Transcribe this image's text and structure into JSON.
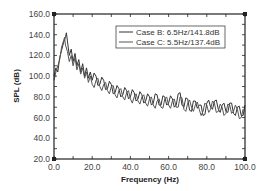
{
  "chart_data": {
    "type": "line",
    "title": "",
    "xlabel": "Frequency (Hz)",
    "ylabel": "SPL (dB)",
    "xlim": [
      0,
      100
    ],
    "ylim": [
      20,
      160
    ],
    "x_ticks": [
      "0.0",
      "20.0",
      "40.0",
      "60.0",
      "80.0",
      "100.0"
    ],
    "y_ticks": [
      "20.0",
      "40.0",
      "60.0",
      "80.0",
      "100.0",
      "120.0",
      "140.0",
      "160.0"
    ],
    "grid": false,
    "legend_position": "upper right",
    "series": [
      {
        "name": "Case B: 6.5Hz/141.8dB",
        "color": "#333333",
        "x": [
          0,
          1,
          2,
          3,
          4,
          5,
          6,
          6.5,
          7,
          8,
          9,
          10,
          11,
          12,
          13,
          14,
          15,
          16,
          17,
          18,
          19,
          20,
          22,
          24,
          26,
          28,
          30,
          32,
          34,
          36,
          38,
          40,
          42,
          44,
          46,
          48,
          50,
          52,
          54,
          56,
          58,
          60,
          62,
          64,
          66,
          68,
          70,
          72,
          74,
          76,
          78,
          80,
          82,
          84,
          86,
          88,
          90,
          92,
          94,
          96,
          98,
          100
        ],
        "y": [
          100,
          108,
          104,
          118,
          125,
          132,
          138,
          141.8,
          134,
          120,
          126,
          114,
          122,
          110,
          116,
          104,
          112,
          100,
          108,
          98,
          104,
          96,
          100,
          92,
          96,
          88,
          92,
          84,
          88,
          82,
          86,
          80,
          84,
          78,
          82,
          76,
          80,
          74,
          82,
          72,
          80,
          74,
          78,
          72,
          84,
          70,
          78,
          66,
          76,
          72,
          62,
          74,
          70,
          76,
          68,
          72,
          66,
          74,
          64,
          70,
          62,
          72
        ],
        "peak": {
          "frequency_hz": 6.5,
          "spl_db": 141.8
        }
      },
      {
        "name": "Case C: 5.5Hz/137.4dB",
        "color": "#555555",
        "x": [
          0,
          1,
          2,
          3,
          4,
          5,
          5.5,
          6,
          7,
          8,
          9,
          10,
          11,
          12,
          13,
          14,
          15,
          16,
          17,
          18,
          19,
          20,
          22,
          24,
          26,
          28,
          30,
          32,
          34,
          36,
          38,
          40,
          42,
          44,
          46,
          48,
          50,
          52,
          54,
          56,
          58,
          60,
          62,
          64,
          66,
          68,
          70,
          72,
          74,
          76,
          78,
          80,
          82,
          84,
          86,
          88,
          90,
          92,
          94,
          96,
          98,
          100
        ],
        "y": [
          96,
          104,
          110,
          116,
          128,
          134,
          137.4,
          130,
          124,
          114,
          120,
          110,
          118,
          106,
          112,
          102,
          108,
          98,
          104,
          94,
          100,
          92,
          96,
          90,
          92,
          86,
          90,
          82,
          86,
          80,
          84,
          78,
          80,
          76,
          80,
          74,
          78,
          72,
          76,
          70,
          78,
          72,
          76,
          70,
          80,
          68,
          74,
          70,
          72,
          68,
          66,
          72,
          68,
          74,
          66,
          70,
          64,
          72,
          66,
          68,
          60,
          66
        ],
        "peak": {
          "frequency_hz": 5.5,
          "spl_db": 137.4
        }
      }
    ]
  },
  "legend": {
    "entries": [
      "Case B: 6.5Hz/141.8dB",
      "Case C: 5.5Hz/137.4dB"
    ]
  },
  "axes": {
    "x_title": "Frequency (Hz)",
    "y_title": "SPL (dB)"
  }
}
